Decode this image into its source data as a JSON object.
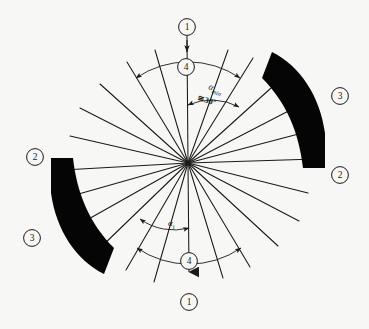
{
  "figure": {
    "name": "rotary-cutter-head-blade-angle-diagram",
    "background_color": "#f7f7f5",
    "line_color": "#1a1a1a",
    "blade_fill": "#050505",
    "center": {
      "x": 188,
      "y": 163
    }
  },
  "annotations": {
    "alpha_min": "α",
    "alpha_min_sub": "min",
    "alpha_min_value": "≅30°",
    "alpha_i": "α",
    "alpha_i_sub": "i"
  },
  "callouts": [
    {
      "id": "callout-1-top",
      "label": "1",
      "x": 187,
      "y": 27
    },
    {
      "id": "callout-4-top",
      "label": "4",
      "x": 186,
      "y": 67
    },
    {
      "id": "callout-3-right",
      "label": "3",
      "x": 340,
      "y": 96
    },
    {
      "id": "callout-2-right",
      "label": "2",
      "x": 340,
      "y": 175
    },
    {
      "id": "callout-2-left",
      "label": "2",
      "x": 35,
      "y": 157
    },
    {
      "id": "callout-3-left",
      "label": "3",
      "x": 32,
      "y": 238
    },
    {
      "id": "callout-4-bottom",
      "label": "4",
      "x": 189,
      "y": 261
    },
    {
      "id": "callout-1-bottom",
      "label": "1",
      "x": 189,
      "y": 302
    }
  ],
  "spokes": {
    "count_visible": 24,
    "description": "radial blade-slot lines emanating from hub",
    "angles_deg": [
      8,
      26,
      44,
      62,
      80,
      98,
      116,
      134,
      152,
      170,
      188,
      206,
      224,
      242,
      260,
      278,
      296,
      314,
      332,
      350,
      17,
      107,
      197,
      287
    ]
  },
  "arcs": {
    "alpha_min_arc": {
      "start_deg": 90,
      "end_deg": 62,
      "radius": 58,
      "double_arrow": true
    },
    "alpha_min_wide_arc": {
      "start_deg": 117,
      "end_deg": 62,
      "radius": 92,
      "double_arrow": true
    },
    "alpha_i_arc": {
      "start_deg": 270,
      "end_deg": 242,
      "radius": 58,
      "double_arrow": true
    },
    "alpha_i_wide_arc": {
      "start_deg": 297,
      "end_deg": 242,
      "radius": 92,
      "double_arrow": true
    }
  },
  "blades": [
    {
      "id": "blade-upper-right",
      "rotation_deg": 0,
      "fill": "#050505"
    },
    {
      "id": "blade-lower-left",
      "rotation_deg": 180,
      "fill": "#050505"
    }
  ]
}
